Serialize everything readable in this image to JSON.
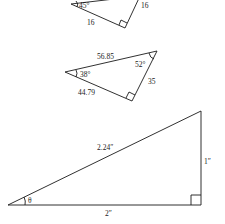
{
  "diagram": {
    "triangles": [
      {
        "id": "top",
        "angle_label": "45°",
        "adjacent_label": "16",
        "opposite_label": "16"
      },
      {
        "id": "middle",
        "hypotenuse_label": "56.85",
        "left_angle_label": "38°",
        "right_angle_label": "52°",
        "opposite_label": "35",
        "adjacent_label": "44.79"
      },
      {
        "id": "bottom",
        "hypotenuse_label": "2.24″",
        "opposite_label": "1″",
        "adjacent_label": "2″",
        "angle_label": "θ"
      }
    ]
  }
}
